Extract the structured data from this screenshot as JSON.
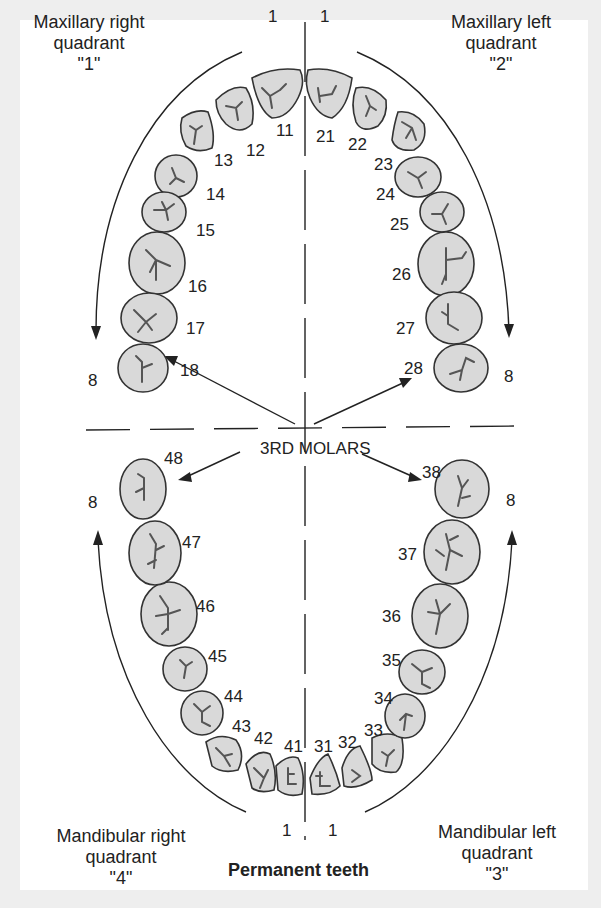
{
  "title": "Permanent teeth",
  "quadrants": {
    "upper_right": {
      "line1": "Maxillary right",
      "line2": "quadrant",
      "line3": "\"1\""
    },
    "upper_left": {
      "line1": "Maxillary left",
      "line2": "quadrant",
      "line3": "\"2\""
    },
    "lower_right": {
      "line1": "Mandibular right",
      "line2": "quadrant",
      "line3": "\"4\""
    },
    "lower_left": {
      "line1": "Mandibular left",
      "line2": "quadrant",
      "line3": "\"3\""
    }
  },
  "center_label": "3RD MOLARS",
  "range_labels": {
    "start": "1",
    "end": "8"
  },
  "teeth": {
    "upper_right": [
      "11",
      "12",
      "13",
      "14",
      "15",
      "16",
      "17",
      "18"
    ],
    "upper_left": [
      "21",
      "22",
      "23",
      "24",
      "25",
      "26",
      "27",
      "28"
    ],
    "lower_left": [
      "31",
      "32",
      "33",
      "34",
      "35",
      "36",
      "37",
      "38"
    ],
    "lower_right": [
      "41",
      "42",
      "43",
      "44",
      "45",
      "46",
      "47",
      "48"
    ]
  },
  "colors": {
    "tooth_fill": "#d9d9d9",
    "outline": "#333333",
    "background": "#ffffff"
  }
}
